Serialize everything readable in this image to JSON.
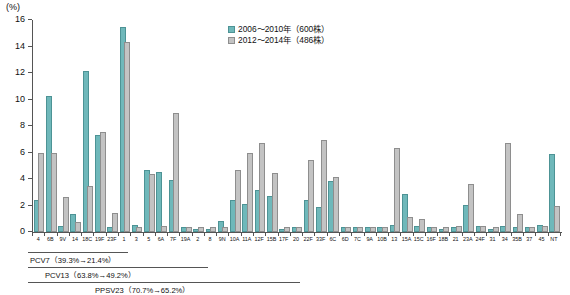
{
  "chart_data": {
    "type": "bar",
    "title": "",
    "xlabel": "",
    "ylabel": "(%)",
    "ylim": [
      0,
      16
    ],
    "yticks": [
      0,
      2,
      4,
      6,
      8,
      10,
      12,
      14,
      16
    ],
    "grid": false,
    "legend_position": "top-center",
    "categories": [
      "4",
      "6B",
      "9V",
      "14",
      "18C",
      "19F",
      "23F",
      "1",
      "3",
      "5",
      "6A",
      "7F",
      "19A",
      "2",
      "8",
      "9N",
      "10A",
      "11A",
      "12F",
      "15B",
      "17F",
      "20",
      "22F",
      "33F",
      "6C",
      "6D",
      "7C",
      "9A",
      "10B",
      "13",
      "15A",
      "15C",
      "16F",
      "18B",
      "21",
      "23A",
      "24F",
      "31",
      "34",
      "35B",
      "37",
      "45",
      "NT"
    ],
    "series": [
      {
        "name": "2006～2010年（600株）",
        "color": "#6fb8ba",
        "values": [
          2.3,
          10.1,
          0.3,
          1.2,
          12.0,
          7.2,
          0.2,
          15.3,
          0.4,
          4.5,
          4.4,
          3.8,
          0.2,
          0.1,
          0.1,
          0.7,
          2.3,
          2.0,
          3.0,
          2.6,
          0.1,
          0.2,
          2.3,
          1.7,
          3.7,
          0.2,
          0.2,
          0.2,
          0.2,
          0.4,
          2.7,
          0.3,
          0.2,
          0.1,
          0.2,
          1.9,
          0.3,
          0.1,
          0.3,
          0.2,
          0.2,
          0.4,
          5.7
        ]
      },
      {
        "name": "2012～2014年（486株）",
        "color": "#c3c3c3",
        "values": [
          5.8,
          5.8,
          2.5,
          0.6,
          3.3,
          7.4,
          1.3,
          14.2,
          0.2,
          4.2,
          0.3,
          8.8,
          0.2,
          0.2,
          0.2,
          0.2,
          4.5,
          5.8,
          6.6,
          4.3,
          0.2,
          0.2,
          5.3,
          6.8,
          4.0,
          0.2,
          0.2,
          0.2,
          0.2,
          6.2,
          1.0,
          0.8,
          0.2,
          0.2,
          0.3,
          3.5,
          0.3,
          0.2,
          6.6,
          1.2,
          0.2,
          0.3,
          1.8
        ]
      }
    ],
    "annotations": [
      {
        "name": "PCV7",
        "label": "PCV7（39.3%→21.4%）",
        "from_pct": 39.3,
        "to_pct": 21.4,
        "covers": [
          "4",
          "6B",
          "9V",
          "14",
          "18C",
          "19F",
          "23F"
        ]
      },
      {
        "name": "PCV13",
        "label": "PCV13（63.8%→49.2%）",
        "from_pct": 63.8,
        "to_pct": 49.2,
        "covers": [
          "4",
          "6B",
          "9V",
          "14",
          "18C",
          "19F",
          "23F",
          "1",
          "3",
          "5",
          "6A",
          "7F",
          "19A"
        ]
      },
      {
        "name": "PPSV23",
        "label": "PPSV23（70.7%→65.2%）",
        "from_pct": 70.7,
        "to_pct": 65.2,
        "covers": [
          "4",
          "6B",
          "9V",
          "14",
          "18C",
          "19F",
          "23F",
          "1",
          "3",
          "5",
          "7F",
          "19A",
          "2",
          "8",
          "9N",
          "10A",
          "11A",
          "12F",
          "15B",
          "17F",
          "20",
          "22F",
          "33F"
        ]
      }
    ]
  },
  "axis": {
    "y_unit": "(%)"
  },
  "legend": {
    "items": [
      {
        "label": "2006～2010年（600株）"
      },
      {
        "label": "2012～2014年（486株）"
      }
    ]
  }
}
